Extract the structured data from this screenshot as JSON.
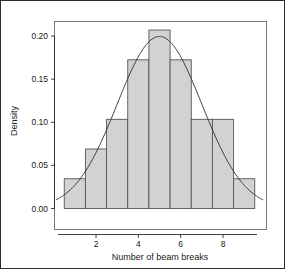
{
  "figure": {
    "background": "#ffffff",
    "border_color": "#2b2b2b"
  },
  "chart_data": {
    "type": "bar",
    "title": "",
    "subtitle": "",
    "xlabel": "Number of beam breaks",
    "ylabel": "Density",
    "categories": [
      "0.5-1.5",
      "1.5-2.5",
      "2.5-3.5",
      "3.5-4.5",
      "4.5-5.5",
      "5.5-6.5",
      "6.5-7.5",
      "7.5-8.5",
      "8.5-9.5"
    ],
    "bin_edges": [
      0.5,
      1.5,
      2.5,
      3.5,
      4.5,
      5.5,
      6.5,
      7.5,
      8.5,
      9.5
    ],
    "bin_centers": [
      1,
      2,
      3,
      4,
      5,
      6,
      7,
      8,
      9
    ],
    "values": [
      0.0345,
      0.069,
      0.1034,
      0.1724,
      0.2069,
      0.1724,
      0.1034,
      0.1034,
      0.0345
    ],
    "xlim": [
      0.1,
      9.9
    ],
    "ylim": [
      0.0,
      0.215
    ],
    "xticks": [
      2,
      4,
      6,
      8
    ],
    "xtick_labels": [
      "2",
      "4",
      "6",
      "8"
    ],
    "yticks": [
      0.0,
      0.05,
      0.1,
      0.15,
      0.2
    ],
    "ytick_labels": [
      "0.00",
      "0.05",
      "0.10",
      "0.15",
      "0.20"
    ],
    "grid": false,
    "legend": null,
    "bar_fill": "#d2d2d2",
    "bar_stroke": "#555555",
    "overlay": {
      "type": "line",
      "name": "normal density curve",
      "color": "#2b2b2b",
      "distribution": "normal",
      "mean": 5.0,
      "sd": 2.0,
      "peak_value": 0.1995
    }
  }
}
